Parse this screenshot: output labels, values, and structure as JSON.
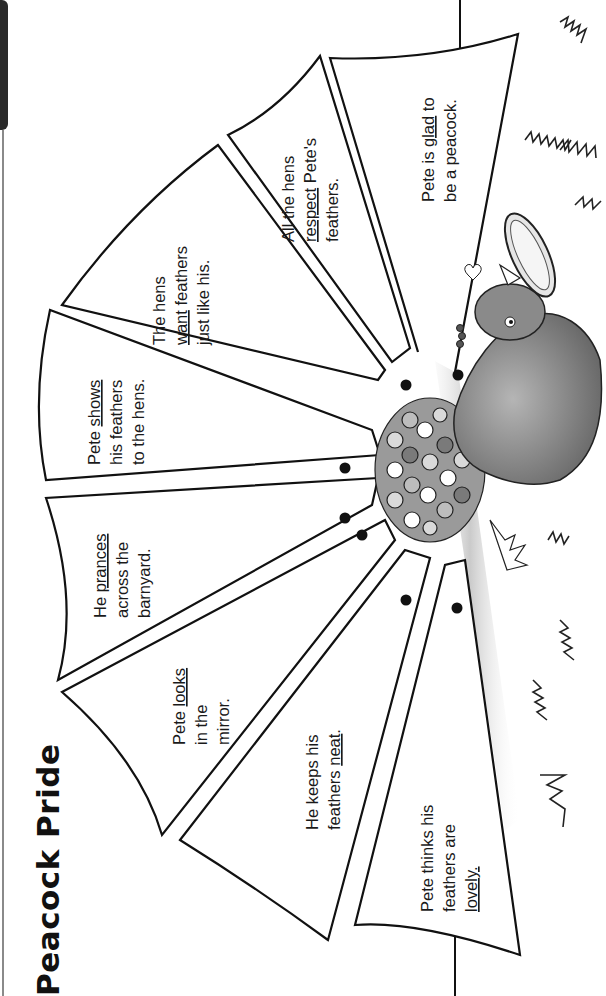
{
  "worksheet": {
    "title": "Peacock Pride",
    "orientation": "rotated -90deg (landscape page shown in portrait)",
    "feathers": [
      {
        "id": 1,
        "lines": [
          "Pete thinks his",
          "feathers are",
          "lovely."
        ],
        "underlined_word": "lovely"
      },
      {
        "id": 2,
        "lines": [
          "He keeps his",
          "feathers neat."
        ],
        "underlined_word": "neat"
      },
      {
        "id": 3,
        "lines": [
          "Pete looks",
          "in the",
          "mirror."
        ],
        "underlined_word": "looks"
      },
      {
        "id": 4,
        "lines": [
          "He prances",
          "across the",
          "barnyard."
        ],
        "underlined_word": "prances"
      },
      {
        "id": 5,
        "lines": [
          "Pete shows",
          "his feathers",
          "to the hens."
        ],
        "underlined_word": "shows"
      },
      {
        "id": 6,
        "lines": [
          "The hens",
          "want feathers",
          "just like his."
        ],
        "underlined_word": "want"
      },
      {
        "id": 7,
        "lines": [
          "All the hens",
          "respect Pete's",
          "feathers."
        ],
        "underlined_word": "respect"
      },
      {
        "id": 8,
        "lines": [
          "Pete is glad to",
          "be a peacock."
        ],
        "underlined_word": "glad"
      }
    ],
    "punch_dots": 7,
    "illustration": "peacock-holding-mirror",
    "colors": {
      "ink": "#111111",
      "paper": "#ffffff",
      "shadow": "#bdbdbd",
      "feather_dark": "#7a7a7a",
      "feather_light": "#d9d9d9",
      "tab": "#2a2a2a"
    }
  }
}
